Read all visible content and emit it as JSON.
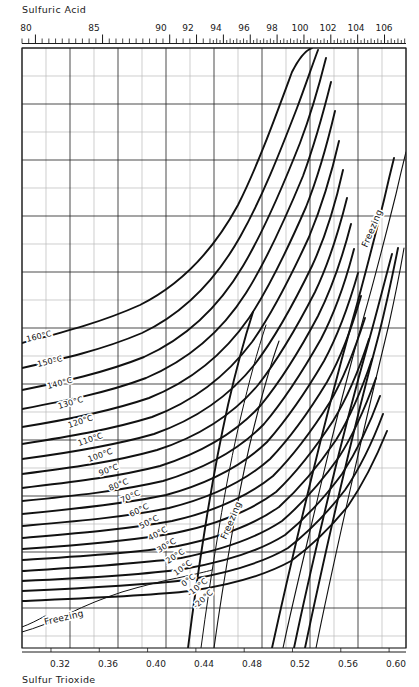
{
  "chart_data": {
    "type": "line",
    "title": "",
    "top_axis": {
      "label": "Sulfuric Acid",
      "ticks": [
        80,
        85,
        90,
        92,
        94,
        96,
        98,
        100,
        102,
        104,
        106
      ],
      "range": [
        79.0,
        107.6
      ],
      "minor_step": 0.5
    },
    "bottom_axis": {
      "label": "Sulfur Trioxide",
      "ticks": [
        "0.32",
        "0.36",
        "0.40",
        "0.44",
        "0.48",
        "0.52",
        "0.56",
        "0.60"
      ],
      "tick_values": [
        0.32,
        0.36,
        0.4,
        0.44,
        0.48,
        0.52,
        0.56,
        0.6
      ],
      "range": [
        0.296,
        0.614
      ]
    },
    "ylabel": "",
    "xlabel": "Sulfuric Acid  /  Sulfur Trioxide",
    "grid": true,
    "legend": "none",
    "series": [
      {
        "name": "160°C",
        "label": "160°C"
      },
      {
        "name": "150°C",
        "label": "150°C"
      },
      {
        "name": "140°C",
        "label": "140°C"
      },
      {
        "name": "130°C",
        "label": "130°C"
      },
      {
        "name": "120°C",
        "label": "120°C"
      },
      {
        "name": "110°C",
        "label": "110°C"
      },
      {
        "name": "100°C",
        "label": "100°C"
      },
      {
        "name": "90°C",
        "label": "90°C"
      },
      {
        "name": "80°C",
        "label": "80°C"
      },
      {
        "name": "70°C",
        "label": "70°C"
      },
      {
        "name": "60°C",
        "label": "60°C"
      },
      {
        "name": "50°C",
        "label": "50°C"
      },
      {
        "name": "40°C",
        "label": "40°C"
      },
      {
        "name": "30°C",
        "label": "30°C"
      },
      {
        "name": "20°C",
        "label": "20°C"
      },
      {
        "name": "10°C",
        "label": "10°C"
      },
      {
        "name": "0°C",
        "label": "0°C"
      },
      {
        "name": "-10°C",
        "label": "-10°C"
      },
      {
        "name": "-20°C",
        "label": "-20°C"
      }
    ],
    "annotations": [
      {
        "text": "Freezing",
        "position": "lower-left"
      },
      {
        "text": "Freezing",
        "position": "center"
      },
      {
        "text": "Freezing",
        "position": "upper-right"
      }
    ]
  },
  "top_axis_label": "Sulfuric Acid",
  "bottom_axis_label": "Sulfur Trioxide",
  "top_ticks": [
    {
      "text": "80"
    },
    {
      "text": "85"
    },
    {
      "text": "90"
    },
    {
      "text": "92"
    },
    {
      "text": "94"
    },
    {
      "text": "96"
    },
    {
      "text": "98"
    },
    {
      "text": "100"
    },
    {
      "text": "102"
    },
    {
      "text": "104"
    },
    {
      "text": "106"
    }
  ],
  "bottom_ticks": [
    {
      "text": "0.32"
    },
    {
      "text": "0.36"
    },
    {
      "text": "0.40"
    },
    {
      "text": "0.44"
    },
    {
      "text": "0.48"
    },
    {
      "text": "0.52"
    },
    {
      "text": "0.56"
    },
    {
      "text": "0.60"
    }
  ],
  "curve_labels": [
    {
      "text": "160°C"
    },
    {
      "text": "150°C"
    },
    {
      "text": "140°C"
    },
    {
      "text": "130°C"
    },
    {
      "text": "120°C"
    },
    {
      "text": "110°C"
    },
    {
      "text": "100°C"
    },
    {
      "text": "90°C"
    },
    {
      "text": "80°C"
    },
    {
      "text": "70°C"
    },
    {
      "text": "60°C"
    },
    {
      "text": "50°C"
    },
    {
      "text": "40°C"
    },
    {
      "text": "30°C"
    },
    {
      "text": "20°C"
    },
    {
      "text": "10°C"
    },
    {
      "text": "0°C"
    },
    {
      "text": "-10°C"
    },
    {
      "text": "-20°C"
    }
  ],
  "freezing_labels": [
    {
      "text": "Freezing"
    },
    {
      "text": "Freezing"
    },
    {
      "text": "Freezing"
    }
  ],
  "colors": {
    "ink": "#111111",
    "grid_major": "#2b2b2b",
    "grid_minor": "#b9b9b9",
    "background": "#ffffff"
  }
}
